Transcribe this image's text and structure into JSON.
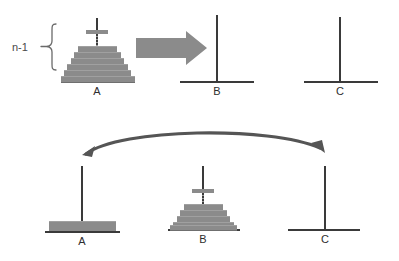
{
  "figure": {
    "annotation_label": "n-1",
    "disk_color": "#8b8b8b",
    "peg_color": "#3a3a3a",
    "arrow_color": "#7b7b7b",
    "curve_arrow_color": "#555555",
    "background": "#ffffff"
  },
  "rows": [
    {
      "id": "row-top",
      "pegs": [
        {
          "label": "A",
          "state": "stacked",
          "disk_count": 6,
          "has_top_disk": true,
          "has_dots": true
        },
        {
          "label": "B",
          "state": "empty",
          "disk_count": 0,
          "has_top_disk": false,
          "has_dots": false
        },
        {
          "label": "C",
          "state": "empty",
          "disk_count": 0,
          "has_top_disk": false,
          "has_dots": false
        }
      ],
      "arrow": {
        "type": "straight-right",
        "from": "A",
        "to": "B"
      }
    },
    {
      "id": "row-bottom",
      "pegs": [
        {
          "label": "A",
          "state": "single-large-disk",
          "disk_count": 1,
          "has_top_disk": false,
          "has_dots": false
        },
        {
          "label": "B",
          "state": "stacked",
          "disk_count": 6,
          "has_top_disk": true,
          "has_dots": true
        },
        {
          "label": "C",
          "state": "empty",
          "disk_count": 0,
          "has_top_disk": false,
          "has_dots": false
        }
      ],
      "arrow": {
        "type": "curved",
        "from": "A",
        "to": "C"
      }
    }
  ]
}
